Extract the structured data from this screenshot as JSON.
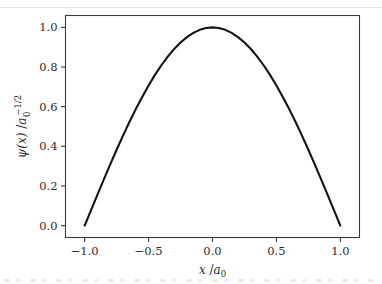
{
  "figure": {
    "background_color": "#ffffff",
    "curve_color": "#131313",
    "axis_color": "#3a3a3f",
    "text_color": "#2b2b30"
  },
  "axes": {
    "x": {
      "label_main": "x",
      "label_separator": " /",
      "label_unit": "a",
      "label_unit_sub": "0",
      "label_full": "x /a₀",
      "ticks": [
        "−1.0",
        "−0.5",
        "0.0",
        "0.5",
        "1.0"
      ],
      "tick_values": [
        -1.0,
        -0.5,
        0.0,
        0.5,
        1.0
      ],
      "range": [
        -1.15,
        1.15
      ]
    },
    "y": {
      "label_main": "ψ(x)",
      "label_separator": " /",
      "label_unit": "a",
      "label_unit_sub": "0",
      "label_unit_sup": "−1/2",
      "label_full": "ψ(x) /a₀⁻¹ᐟ²",
      "ticks": [
        "0.0",
        "0.2",
        "0.4",
        "0.6",
        "0.8",
        "1.0"
      ],
      "tick_values": [
        0.0,
        0.2,
        0.4,
        0.6,
        0.8,
        1.0
      ],
      "range": [
        -0.06,
        1.06
      ]
    }
  },
  "chart_data": {
    "type": "line",
    "title": "",
    "subtitle": "",
    "xlabel": "x /a₀",
    "ylabel": "ψ(x) /a₀^(-1/2)",
    "xlim": [
      -1.15,
      1.15
    ],
    "ylim": [
      -0.06,
      1.06
    ],
    "grid": false,
    "legend": false,
    "legend_position": "none",
    "annotations": [],
    "series": [
      {
        "name": "ψ(x) = cos(πx/2)",
        "color": "#131313",
        "linewidth": 2.1,
        "x": [
          -1.0,
          -0.95,
          -0.9,
          -0.85,
          -0.8,
          -0.75,
          -0.7,
          -0.65,
          -0.6,
          -0.55,
          -0.5,
          -0.45,
          -0.4,
          -0.35,
          -0.3,
          -0.25,
          -0.2,
          -0.15,
          -0.1,
          -0.05,
          0.0,
          0.05,
          0.1,
          0.15,
          0.2,
          0.25,
          0.3,
          0.35,
          0.4,
          0.45,
          0.5,
          0.55,
          0.6,
          0.65,
          0.7,
          0.75,
          0.8,
          0.85,
          0.9,
          0.95,
          1.0
        ],
        "values": [
          0.0,
          0.0785,
          0.1564,
          0.2334,
          0.309,
          0.3827,
          0.454,
          0.5225,
          0.5878,
          0.6494,
          0.7071,
          0.7604,
          0.809,
          0.8526,
          0.891,
          0.9239,
          0.9511,
          0.9724,
          0.9877,
          0.9969,
          1.0,
          0.9969,
          0.9877,
          0.9724,
          0.9511,
          0.9239,
          0.891,
          0.8526,
          0.809,
          0.7604,
          0.7071,
          0.6494,
          0.5878,
          0.5225,
          0.454,
          0.3827,
          0.309,
          0.2334,
          0.1564,
          0.0785,
          0.0
        ]
      }
    ]
  }
}
